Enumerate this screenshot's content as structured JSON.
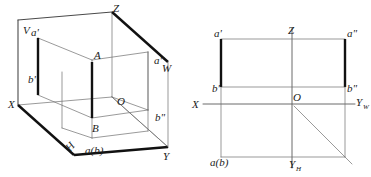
{
  "pictorial": {
    "name": "axonometric-view",
    "plane_labels": {
      "v": "V",
      "h": "H",
      "w": "W"
    },
    "axis_labels": {
      "x": "X",
      "y": "Y",
      "z": "Z",
      "origin": "O"
    },
    "point_labels": {
      "a_space": "A",
      "b_space": "B",
      "a_front": "a'",
      "b_front": "b'",
      "a_side": "a\"",
      "b_side": "b\"",
      "a_top": "a(b)"
    }
  },
  "orthographic": {
    "name": "multiview-projection",
    "axis_labels": {
      "x": "X",
      "z": "Z",
      "y_w": "Y",
      "y_w_sub": "W",
      "y_h": "Y",
      "y_h_sub": "H",
      "origin": "O"
    },
    "point_labels": {
      "a_front": "a'",
      "b_front": "b'",
      "a_side": "a\"",
      "b_side": "b\"",
      "a_top": "a(b)"
    }
  },
  "colors": {
    "background": "#ffffff",
    "thin_line": "#6f6f6f",
    "medium_line": "#4a4a4a",
    "heavy_line": "#111111",
    "text": "#1a1a1a"
  }
}
